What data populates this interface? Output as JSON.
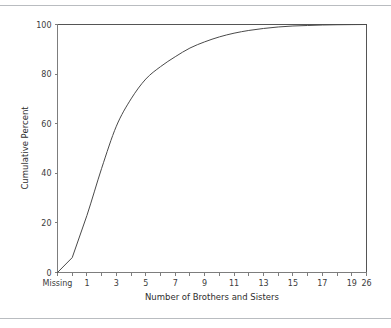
{
  "chart_data": {
    "type": "line",
    "title": "",
    "xlabel": "Number of Brothers and Sisters",
    "ylabel": "Cumulative Percent",
    "categories": [
      "Missing",
      "0",
      "1",
      "2",
      "3",
      "4",
      "5",
      "6",
      "7",
      "8",
      "9",
      "10",
      "11",
      "12",
      "13",
      "14",
      "15",
      "16",
      "17",
      "18",
      "19",
      "26"
    ],
    "x_tick_labels": [
      "Missing",
      "",
      "1",
      "",
      "3",
      "",
      "5",
      "",
      "7",
      "",
      "9",
      "",
      "11",
      "",
      "13",
      "",
      "15",
      "",
      "17",
      "",
      "19",
      "26"
    ],
    "values": [
      0,
      6,
      23,
      42,
      59,
      70,
      78,
      83,
      87,
      90.5,
      93,
      95,
      96.5,
      97.6,
      98.4,
      99,
      99.4,
      99.6,
      99.8,
      99.9,
      99.95,
      100
    ],
    "y_tick_labels": [
      "0",
      "20",
      "40",
      "60",
      "80",
      "100"
    ],
    "y_ticks": [
      0,
      20,
      40,
      60,
      80,
      100
    ],
    "ylim": [
      0,
      100
    ],
    "grid": false,
    "legend": false,
    "legend_position": "none",
    "series": [
      {
        "name": "Cumulative Percent",
        "color": "#4a4a4a",
        "values": [
          0,
          6,
          23,
          42,
          59,
          70,
          78,
          83,
          87,
          90.5,
          93,
          95,
          96.5,
          97.6,
          98.4,
          99,
          99.4,
          99.6,
          99.8,
          99.9,
          99.95,
          100
        ]
      }
    ]
  },
  "figure": {
    "background_color": "#ffffff",
    "rule_color": "#b9bcc0",
    "axis_color": "#7d7d7d",
    "frame_color": "#555555",
    "curve_color": "#4a4a4a"
  }
}
